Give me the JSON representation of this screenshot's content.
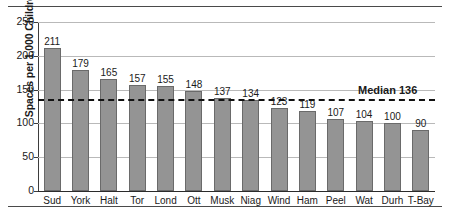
{
  "chart_data": {
    "type": "bar",
    "title": "",
    "xlabel": "",
    "ylabel": "Spaces per 1,000 Children",
    "ylim": [
      0,
      250
    ],
    "yticks": [
      0,
      50,
      100,
      150,
      200,
      250
    ],
    "grid": true,
    "legend": null,
    "categories": [
      "Sud",
      "York",
      "Halt",
      "Tor",
      "Lond",
      "Ott",
      "Musk",
      "Niag",
      "Wind",
      "Ham",
      "Peel",
      "Wat",
      "Durh",
      "T-Bay"
    ],
    "values": [
      211,
      179,
      165,
      157,
      155,
      148,
      137,
      134,
      123,
      119,
      107,
      104,
      100,
      90
    ],
    "annotations": [
      {
        "name": "median-line",
        "label": "Median 136",
        "value": 136,
        "style": "dashed-horizontal"
      }
    ],
    "colors": {
      "bar_fill": "#949494",
      "bar_edge": "#6a6a6a",
      "grid": "#b9b9b9",
      "axis": "#2b2b2b",
      "rule": "#4a4a4a",
      "text": "#1a1a1a"
    }
  }
}
